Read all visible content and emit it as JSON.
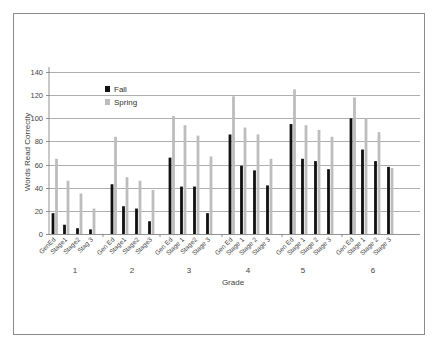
{
  "chart_data": {
    "type": "bar",
    "title": "",
    "xlabel": "Grade",
    "ylabel": "Words Read Correctly",
    "ylim": [
      0,
      140
    ],
    "yticks": [
      0,
      20,
      40,
      60,
      80,
      100,
      120,
      140
    ],
    "grid": true,
    "legend_position": "upper-left-inside",
    "groups": [
      "1",
      "2",
      "3",
      "4",
      "5",
      "6"
    ],
    "categories": [
      [
        "GenEd",
        "Stage1",
        "Stage2",
        "Stag 3"
      ],
      [
        "Gen Ed",
        "Stage1",
        "Stage2",
        "Stage3"
      ],
      [
        "Gen Ed",
        "Stage 1",
        "Stage2",
        "Stage 3"
      ],
      [
        "Gen Ed",
        "Stage 1",
        "Stage 2",
        "Stage 3"
      ],
      [
        "Gen Ed",
        "Stage 1",
        "Stage 2",
        "Stage 3"
      ],
      [
        "Gen Ed",
        "Stage 1",
        "Stage 2",
        "Stage 3"
      ]
    ],
    "series": [
      {
        "name": "Fall",
        "color": "#111111",
        "values": [
          [
            18,
            8,
            5,
            4
          ],
          [
            43,
            24,
            22,
            11
          ],
          [
            66,
            41,
            41,
            18
          ],
          [
            86,
            59,
            55,
            42
          ],
          [
            95,
            65,
            63,
            56
          ],
          [
            100,
            73,
            63,
            58
          ]
        ]
      },
      {
        "name": "Spring",
        "color": "#bdbdbd",
        "values": [
          [
            65,
            46,
            35,
            22
          ],
          [
            84,
            49,
            46,
            38
          ],
          [
            102,
            94,
            85,
            67
          ],
          [
            119,
            92,
            86,
            65
          ],
          [
            125,
            94,
            90,
            84
          ],
          [
            118,
            100,
            88,
            57
          ]
        ]
      }
    ]
  }
}
